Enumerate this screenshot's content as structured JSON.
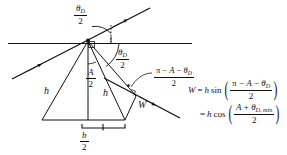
{
  "figure": {
    "name": "prism-beam-width-geometry",
    "type": "optics-ray-diagram",
    "stroke_color": "#111111",
    "background_color": "#ffffff"
  },
  "labels": {
    "theta_top": {
      "numerator": "θ",
      "numerator_sub": "D",
      "denominator": "2"
    },
    "theta_mid": {
      "numerator": "θ",
      "numerator_sub": "D",
      "denominator": "2"
    },
    "half_A": {
      "numerator": "A",
      "denominator": "2"
    },
    "pi_expr": {
      "numerator_pre": "π − ",
      "numerator_A": "A",
      "numerator_mid": " − ",
      "numerator_theta": "θ",
      "numerator_sub": "D",
      "denominator": "2"
    },
    "h_left": "h",
    "h_right": "h",
    "W": "W",
    "b_over_2": {
      "numerator": "b",
      "denominator": "2"
    }
  },
  "equations": {
    "line1": {
      "lhs": "W",
      "equals": "=",
      "coefficient": "h",
      "function": "sin",
      "open_paren": "(",
      "close_paren": ")",
      "numerator_pre": "π − ",
      "numerator_A": "A",
      "numerator_mid": " − ",
      "numerator_theta": "θ",
      "numerator_sub": "D",
      "denominator": "2"
    },
    "line2": {
      "equals": "=",
      "coefficient": "h",
      "function": "cos",
      "open_paren": "(",
      "close_paren": ")",
      "numerator_A": "A",
      "numerator_plus": " + ",
      "numerator_theta": "θ",
      "numerator_sub": "D, min",
      "denominator": "2"
    }
  }
}
